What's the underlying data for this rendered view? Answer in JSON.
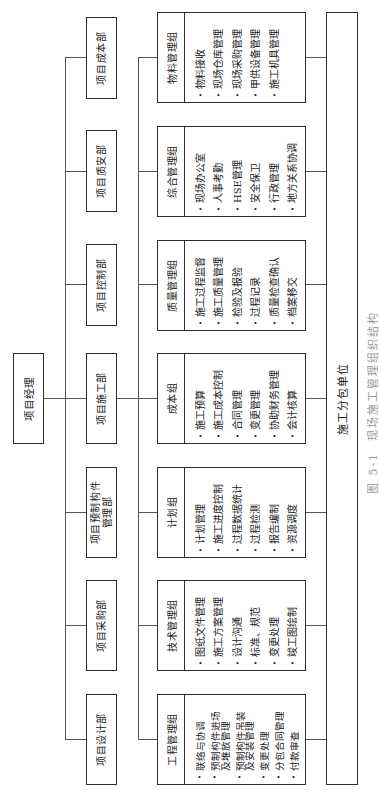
{
  "project_manager": "项目经理",
  "departments": [
    "项目设计部",
    "项目采购部",
    "项目预制构件\n管理部",
    "项目施工部",
    "项目控制部",
    "项目质安部",
    "项目成本部"
  ],
  "groups": [
    {
      "name": "工程管理组",
      "items": [
        "联络与协调",
        "预制构件进场\n及堆放管理",
        "预制构件吊装\n及安装管理",
        "变更处理",
        "分包合同管理",
        "付款审查"
      ]
    },
    {
      "name": "技术管理组",
      "items": [
        "图纸文件管理",
        "施工方案管理",
        "设计沟通",
        "标准、规范",
        "变更处理",
        "竣工图绘制"
      ]
    },
    {
      "name": "计划组",
      "items": [
        "计划管理",
        "施工进度控制",
        "过程数据统计",
        "过程检测",
        "报告编制",
        "资源调度"
      ]
    },
    {
      "name": "成本组",
      "items": [
        "施工预算",
        "施工成本控制",
        "合同管理",
        "变更管理",
        "协助财务管理",
        "会计核算"
      ]
    },
    {
      "name": "质量管理组",
      "items": [
        "施工过程监督",
        "施工质量管理",
        "检验及报验",
        "过程记录",
        "质量检查确认",
        "档案移交"
      ]
    },
    {
      "name": "综合管理组",
      "items": [
        "现场办公室",
        "人事考勤",
        "HSE管理",
        "安全保卫",
        "行政管理",
        "地方关系协调"
      ]
    },
    {
      "name": "物料管理组",
      "items": [
        "物料接收",
        "现场仓库管理",
        "现场采购管理",
        "甲供设备管理",
        "施工机具管理"
      ]
    }
  ],
  "subcontractor": "施工分包单位",
  "caption": {
    "label": "图 5-1  现场施工管理组织结构",
    "number": "图 5-1",
    "title": "现场施工管理组织结构"
  },
  "hierarchy": {
    "root": "项目经理",
    "root_children": "departments",
    "groups_parent": "项目施工部",
    "groups_child": "施工分包单位"
  },
  "colors": {
    "box_border": "#2e2e2e",
    "connector": "#555555",
    "caption": "#9a9a9a",
    "background": "#ffffff"
  }
}
